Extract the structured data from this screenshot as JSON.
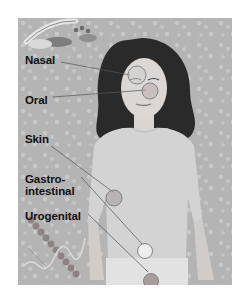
{
  "figure": {
    "background": "microbe-pattern",
    "colors": {
      "frame_bg": "#b9b9b9",
      "circle_fill": "#cfcfcf",
      "circle_stroke": "#7a7a7a",
      "leader_line": "#555555",
      "label_text": "#111111"
    }
  },
  "labels": [
    {
      "id": "nasal",
      "text": "Nasal"
    },
    {
      "id": "oral",
      "text": "Oral"
    },
    {
      "id": "skin",
      "text": "Skin"
    },
    {
      "id": "gastro_line1",
      "text": "Gastro-"
    },
    {
      "id": "gastro_line2",
      "text": "intestinal"
    },
    {
      "id": "urogenital",
      "text": "Urogenital"
    }
  ]
}
